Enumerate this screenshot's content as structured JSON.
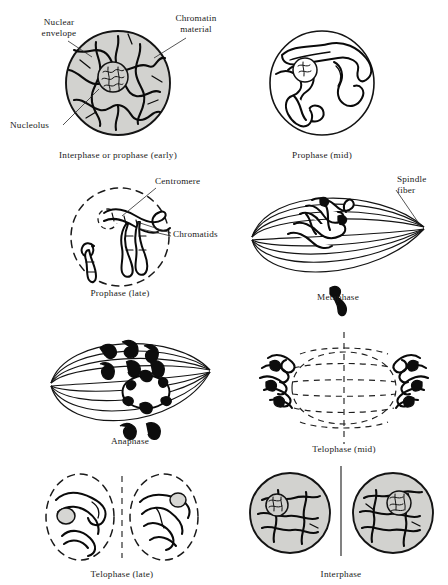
{
  "figure": {
    "background_color": "#ffffff",
    "ink_color": "#0a0a0a",
    "cytoplasm_color": "#d2d2cf"
  },
  "panels": [
    {
      "id": "interphase-early-prophase",
      "caption": "Interphase or prophase (early)",
      "row": 1,
      "column": 1,
      "cell_type": "round-shaded",
      "nuclear_envelope": "solid",
      "nucleolus_visible": true
    },
    {
      "id": "prophase-mid",
      "caption": "Prophase (mid)",
      "row": 1,
      "column": 2,
      "cell_type": "round-clear",
      "nuclear_envelope": "solid",
      "nucleolus_visible": true
    },
    {
      "id": "prophase-late",
      "caption": "Prophase (late)",
      "row": 2,
      "column": 1,
      "cell_type": "round-clear",
      "nuclear_envelope": "dashed",
      "nucleolus_visible": true
    },
    {
      "id": "metaphase",
      "caption": "Metaphase",
      "row": 2,
      "column": 2,
      "cell_type": "spindle",
      "nuclear_envelope": "none",
      "nucleolus_visible": false
    },
    {
      "id": "anaphase",
      "caption": "Anaphase",
      "row": 3,
      "column": 1,
      "cell_type": "spindle",
      "nuclear_envelope": "none",
      "nucleolus_visible": false
    },
    {
      "id": "telophase-mid",
      "caption": "Telophase (mid)",
      "row": 3,
      "column": 2,
      "cell_type": "spindle-dashed",
      "nuclear_envelope": "none",
      "nucleolus_visible": false
    },
    {
      "id": "telophase-late",
      "caption": "Telophase (late)",
      "row": 4,
      "column": 1,
      "cell_type": "two-daughter-clear",
      "nuclear_envelope": "dashed",
      "nucleolus_visible": true
    },
    {
      "id": "interphase",
      "caption": "Interphase",
      "row": 4,
      "column": 2,
      "cell_type": "two-daughter-shaded",
      "nuclear_envelope": "solid",
      "nucleolus_visible": true
    }
  ],
  "annotations": [
    {
      "id": "nuclear-envelope",
      "text_line1": "Nuclear",
      "text_line2": "envelope",
      "panel": "interphase-early-prophase"
    },
    {
      "id": "chromatin-material",
      "text_line1": "Chromatin",
      "text_line2": "material",
      "panel": "interphase-early-prophase"
    },
    {
      "id": "nucleolus",
      "text_line1": "Nucleolus",
      "text_line2": "",
      "panel": "interphase-early-prophase"
    },
    {
      "id": "centromere",
      "text_line1": "Centromere",
      "text_line2": "",
      "panel": "prophase-late"
    },
    {
      "id": "chromatids",
      "text_line1": "Chromatids",
      "text_line2": "",
      "panel": "prophase-late"
    },
    {
      "id": "spindle-fiber",
      "text_line1": "Spindle",
      "text_line2": "fiber",
      "panel": "metaphase"
    }
  ]
}
